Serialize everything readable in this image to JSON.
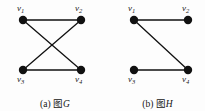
{
  "figure": {
    "background_color": "#fdfdfd",
    "ink_color": "#111111",
    "panels": [
      {
        "id": "graph-g",
        "caption_prefix": "(a)",
        "caption_word": "图",
        "caption_name": "G",
        "caption_full": "(a) 图G",
        "vertices": [
          {
            "id": "v1",
            "label": "v",
            "sub": "1",
            "x": 23,
            "y": 20,
            "label_x": 17,
            "label_y": 4
          },
          {
            "id": "v2",
            "label": "v",
            "sub": "2",
            "x": 81,
            "y": 20,
            "label_x": 75,
            "label_y": 4
          },
          {
            "id": "v3",
            "label": "v",
            "sub": "3",
            "x": 23,
            "y": 70,
            "label_x": 17,
            "label_y": 75
          },
          {
            "id": "v4",
            "label": "v",
            "sub": "4",
            "x": 81,
            "y": 70,
            "label_x": 75,
            "label_y": 75
          }
        ],
        "edges": [
          {
            "from": "v1",
            "to": "v2",
            "x1": 23,
            "y1": 20,
            "x2": 81,
            "y2": 20
          },
          {
            "from": "v3",
            "to": "v4",
            "x1": 23,
            "y1": 70,
            "x2": 81,
            "y2": 70
          },
          {
            "from": "v1",
            "to": "v4",
            "x1": 23,
            "y1": 20,
            "x2": 81,
            "y2": 70
          },
          {
            "from": "v2",
            "to": "v3",
            "x1": 81,
            "y1": 20,
            "x2": 23,
            "y2": 70
          }
        ],
        "vertex_radius": 4.2,
        "edge_width": 1.3
      },
      {
        "id": "graph-h",
        "caption_prefix": "(b)",
        "caption_word": "图",
        "caption_name": "H",
        "caption_full": "(b) 图H",
        "vertices": [
          {
            "id": "v1",
            "label": "v",
            "sub": "1",
            "x": 24,
            "y": 20,
            "label_x": 18,
            "label_y": 4
          },
          {
            "id": "v2",
            "label": "v",
            "sub": "2",
            "x": 78,
            "y": 20,
            "label_x": 72,
            "label_y": 4
          },
          {
            "id": "v3",
            "label": "v",
            "sub": "3",
            "x": 24,
            "y": 70,
            "label_x": 18,
            "label_y": 75
          },
          {
            "id": "v4",
            "label": "v",
            "sub": "4",
            "x": 78,
            "y": 70,
            "label_x": 72,
            "label_y": 75
          }
        ],
        "edges": [
          {
            "from": "v1",
            "to": "v2",
            "x1": 24,
            "y1": 20,
            "x2": 78,
            "y2": 20
          },
          {
            "from": "v3",
            "to": "v4",
            "x1": 24,
            "y1": 70,
            "x2": 78,
            "y2": 70
          },
          {
            "from": "v1",
            "to": "v4",
            "x1": 24,
            "y1": 20,
            "x2": 78,
            "y2": 70
          }
        ],
        "vertex_radius": 4.2,
        "edge_width": 1.3
      }
    ]
  }
}
